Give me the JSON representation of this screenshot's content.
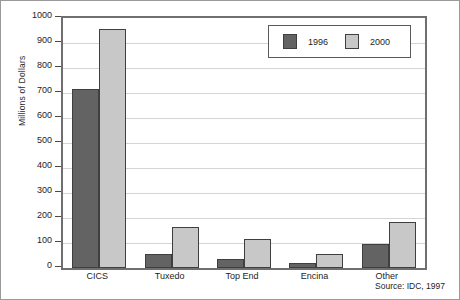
{
  "chart_data": {
    "type": "bar",
    "title": "",
    "xlabel": "",
    "ylabel": "Millions of Dollars",
    "categories": [
      "CICS",
      "Tuxedo",
      "Top End",
      "Encina",
      "Other"
    ],
    "series": [
      {
        "name": "1996",
        "color": "#636363",
        "values": [
          715,
          55,
          35,
          20,
          95
        ]
      },
      {
        "name": "2000",
        "color": "#c8c8c8",
        "values": [
          955,
          165,
          115,
          55,
          185
        ]
      }
    ],
    "ylim": [
      0,
      1000
    ],
    "yticks": [
      0,
      100,
      200,
      300,
      400,
      500,
      600,
      700,
      800,
      900,
      1000
    ],
    "grid": true,
    "legend_position": "top-right",
    "annotations": [
      "Source: IDC, 1997"
    ]
  },
  "source_note": "Source: IDC, 1997"
}
